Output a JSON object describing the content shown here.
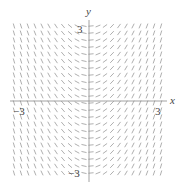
{
  "chart_data": {
    "type": "slope_field",
    "title": "",
    "equation_inferred": "dy/dx = x",
    "xlabel": "x",
    "ylabel": "y",
    "xlim": [
      -3.5,
      3.5
    ],
    "ylim": [
      -3.5,
      3.5
    ],
    "x_tick_labels": [
      "-3",
      "3"
    ],
    "y_tick_labels": [
      "3",
      "-3"
    ],
    "grid": false,
    "grid_spacing": 0.3,
    "segment_color": "#9a9a9a",
    "axis_color": "#8a8a8a"
  },
  "labels": {
    "x_axis": "x",
    "y_axis": "y",
    "x_neg": "−3",
    "x_pos": "3",
    "y_pos": "3",
    "y_neg": "−3"
  }
}
